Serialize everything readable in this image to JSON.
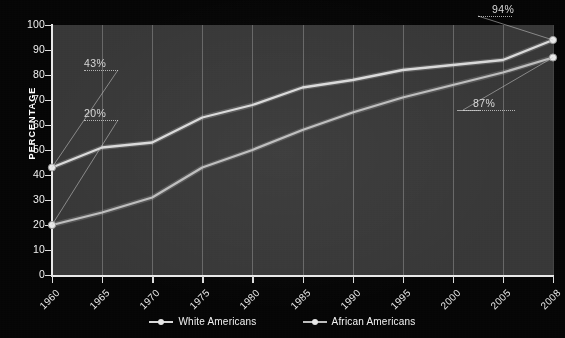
{
  "axis_title_y": "PERCENTAGE",
  "legend": {
    "items": [
      {
        "label": "White Americans",
        "color": "#d9d9d9"
      },
      {
        "label": "African Americans",
        "color": "#bdbdbd"
      }
    ]
  },
  "annotations": [
    {
      "text": "43%",
      "series": "White Americans",
      "year": "1960",
      "value": 43
    },
    {
      "text": "20%",
      "series": "African Americans",
      "year": "1960",
      "value": 20
    },
    {
      "text": "94%",
      "series": "White Americans",
      "year": "2008",
      "value": 94
    },
    {
      "text": "87%",
      "series": "African Americans",
      "year": "2008",
      "value": 87
    }
  ],
  "chart_data": {
    "type": "line",
    "title": "",
    "xlabel": "",
    "ylabel": "PERCENTAGE",
    "categories": [
      "1960",
      "1965",
      "1970",
      "1975",
      "1980",
      "1985",
      "1990",
      "1995",
      "2000",
      "2005",
      "2008"
    ],
    "ylim": [
      0,
      100
    ],
    "yticks": [
      0,
      10,
      20,
      30,
      40,
      50,
      60,
      70,
      80,
      90,
      100
    ],
    "grid": "vertical-gridlines-and-horizontal-bands",
    "legend_position": "bottom-center",
    "series": [
      {
        "name": "White Americans",
        "color": "#d9d9d9",
        "values": [
          43,
          51,
          53,
          63,
          68,
          75,
          78,
          82,
          84,
          86,
          94
        ]
      },
      {
        "name": "African Americans",
        "color": "#bdbdbd",
        "values": [
          20,
          25,
          31,
          43,
          50,
          58,
          65,
          71,
          76,
          81,
          87
        ]
      }
    ]
  }
}
